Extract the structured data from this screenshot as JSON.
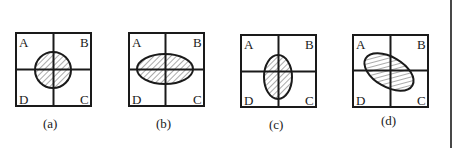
{
  "figure": {
    "panels": [
      {
        "id": "a",
        "caption": "(a)",
        "quadrant_labels": {
          "top_left": "A",
          "top_right": "B",
          "bottom_right": "C",
          "bottom_left": "D"
        },
        "shape": "circle",
        "shape_description": "hatched circle centered at the cross"
      },
      {
        "id": "b",
        "caption": "(b)",
        "quadrant_labels": {
          "top_left": "A",
          "top_right": "B",
          "bottom_right": "C",
          "bottom_left": "D"
        },
        "shape": "horizontal-ellipse",
        "shape_description": "hatched horizontal ellipse centered at the cross"
      },
      {
        "id": "c",
        "caption": "(c)",
        "quadrant_labels": {
          "top_left": "A",
          "top_right": "B",
          "bottom_right": "C",
          "bottom_left": "D"
        },
        "shape": "vertical-ellipse",
        "shape_description": "hatched vertical ellipse centered at the cross"
      },
      {
        "id": "d",
        "caption": "(d)",
        "quadrant_labels": {
          "top_left": "A",
          "top_right": "B",
          "bottom_right": "C",
          "bottom_left": "D"
        },
        "shape": "tilted-ellipse",
        "shape_description": "hatched ellipse tilted from A toward C"
      }
    ],
    "colors": {
      "ink": "#1a1a1a",
      "background": "#ffffff"
    }
  }
}
